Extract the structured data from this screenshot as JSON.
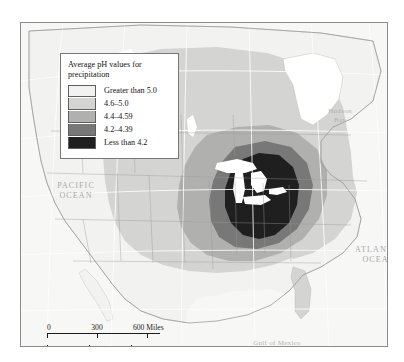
{
  "map": {
    "title_hidden": "",
    "legend": {
      "title": "Average pH values for precipitation",
      "entries": [
        {
          "label": "Greater than 5.0",
          "color": "#f2f2f0",
          "swatch_name": "legend-swatch-greater-than-5"
        },
        {
          "label": "4.6–5.0",
          "color": "#d4d4d2",
          "swatch_name": "legend-swatch-4-6-to-5-0"
        },
        {
          "label": "4.4–4.59",
          "color": "#b0b0ae",
          "swatch_name": "legend-swatch-4-4-to-4-59"
        },
        {
          "label": "4.2–4.39",
          "color": "#787878",
          "swatch_name": "legend-swatch-4-2-to-4-39"
        },
        {
          "label": "Less than 4.2",
          "color": "#1f1f1f",
          "swatch_name": "legend-swatch-less-than-4-2"
        }
      ]
    },
    "labels": {
      "pacific_ocean": "PACIFIC\nOCEAN",
      "pacific_line1": "PACIFIC",
      "pacific_line2": "OCEAN",
      "atlantic_line1": "ATLANTIC",
      "atlantic_line2": "OCEAN",
      "hudson_line1": "Hudson",
      "hudson_line2": "Bay",
      "gulf_of_mexico": "Gulf of Mexico"
    },
    "scales": [
      {
        "unit": "Miles",
        "ticks": [
          "0",
          "300",
          "600 Miles"
        ],
        "name": "scale-bar-miles"
      },
      {
        "unit": "Kilometers",
        "ticks": [
          "0",
          "300",
          "600 Kilometers"
        ],
        "name": "scale-bar-kilometers"
      }
    ],
    "colors": {
      "band_greater_than_5": "#f2f2f0",
      "band_4_6_5_0": "#d4d4d2",
      "band_4_4_4_59": "#b0b0ae",
      "band_4_2_4_39": "#787878",
      "band_less_than_4_2": "#1f1f1f",
      "ocean": "#f7f7f6",
      "water_lakes": "#ffffff",
      "border_line": "#8a8a8a",
      "graticule": "#ffffff",
      "frame": "#8a8a8a"
    }
  }
}
